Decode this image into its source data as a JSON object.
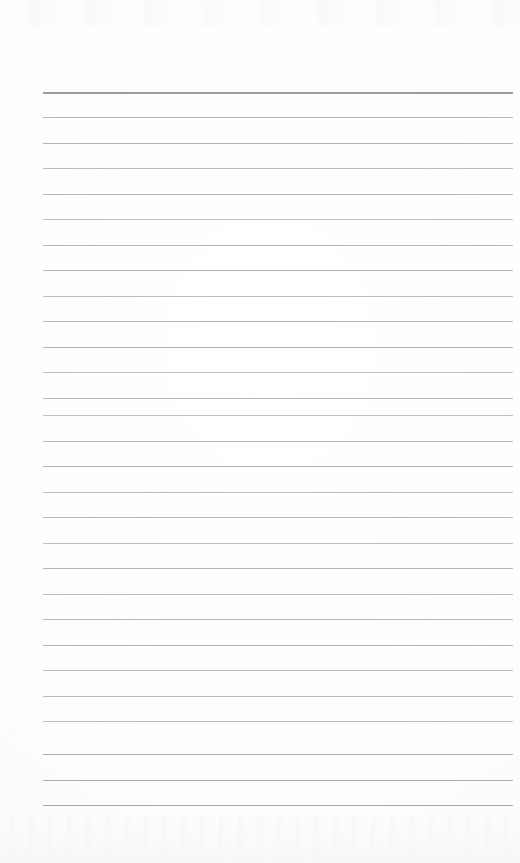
{
  "document": {
    "kind": "scanned-lined-notepad-page",
    "title": "Blank lined notepad page",
    "page_width_px": 520,
    "page_height_px": 863,
    "has_text_content": false,
    "visible_text": "",
    "orientation": "portrait"
  },
  "paper": {
    "background_color": "#fdfdfd",
    "edge_tint_color": "#f9f9fa",
    "noise_color": "#96969e",
    "bottom_smudge_color": "#f1f1f4",
    "top_smudge_color": "#eeeef2"
  },
  "ruling": {
    "line_count": 29,
    "line_color": "#b4b4ba",
    "header_line_color": "#9a9aa0",
    "left_x_px": 43,
    "right_x_px": 513,
    "line_length_px": 470,
    "first_line_y_px": 92,
    "last_line_y_px": 805,
    "line_spacing_px": 25.45,
    "header_line_thickness_px": 2,
    "line_thickness_px": 1,
    "lines": [
      {
        "index": 1,
        "y": 92,
        "weight": "heavy",
        "color": "#9a9aa0",
        "opacity": 1.0
      },
      {
        "index": 2,
        "y": 117,
        "weight": "normal",
        "color": "#b0b0b6",
        "opacity": 0.92
      },
      {
        "index": 3,
        "y": 143,
        "weight": "normal",
        "color": "#aeaeb5",
        "opacity": 0.95
      },
      {
        "index": 4,
        "y": 168,
        "weight": "normal",
        "color": "#b2b2b8",
        "opacity": 0.9
      },
      {
        "index": 5,
        "y": 194,
        "weight": "normal",
        "color": "#b0b0b7",
        "opacity": 0.93
      },
      {
        "index": 6,
        "y": 219,
        "weight": "normal",
        "color": "#b4b4ba",
        "opacity": 0.88
      },
      {
        "index": 7,
        "y": 245,
        "weight": "normal",
        "color": "#b1b1b8",
        "opacity": 0.92
      },
      {
        "index": 8,
        "y": 270,
        "weight": "normal",
        "color": "#afafb6",
        "opacity": 0.94
      },
      {
        "index": 9,
        "y": 296,
        "weight": "normal",
        "color": "#b3b3b9",
        "opacity": 0.89
      },
      {
        "index": 10,
        "y": 321,
        "weight": "normal",
        "color": "#b0b0b7",
        "opacity": 0.93
      },
      {
        "index": 11,
        "y": 347,
        "weight": "normal",
        "color": "#aeaeb5",
        "opacity": 0.95
      },
      {
        "index": 12,
        "y": 372,
        "weight": "normal",
        "color": "#b4b4ba",
        "opacity": 0.88
      },
      {
        "index": 13,
        "y": 398,
        "weight": "normal",
        "color": "#b1b1b8",
        "opacity": 0.92
      },
      {
        "index": 14,
        "y": 415,
        "weight": "normal",
        "color": "#b5b5ba",
        "opacity": 0.86
      },
      {
        "index": 15,
        "y": 441,
        "weight": "normal",
        "color": "#b0b0b7",
        "opacity": 0.93
      },
      {
        "index": 16,
        "y": 466,
        "weight": "normal",
        "color": "#aeaeb5",
        "opacity": 0.95
      },
      {
        "index": 17,
        "y": 492,
        "weight": "normal",
        "color": "#b3b3b9",
        "opacity": 0.89
      },
      {
        "index": 18,
        "y": 517,
        "weight": "normal",
        "color": "#b1b1b8",
        "opacity": 0.92
      },
      {
        "index": 19,
        "y": 543,
        "weight": "normal",
        "color": "#b4b4ba",
        "opacity": 0.88
      },
      {
        "index": 20,
        "y": 568,
        "weight": "normal",
        "color": "#afafb6",
        "opacity": 0.94
      },
      {
        "index": 21,
        "y": 594,
        "weight": "normal",
        "color": "#b2b2b8",
        "opacity": 0.9
      },
      {
        "index": 22,
        "y": 619,
        "weight": "normal",
        "color": "#b0b0b7",
        "opacity": 0.93
      },
      {
        "index": 23,
        "y": 645,
        "weight": "normal",
        "color": "#aeaeb5",
        "opacity": 0.95
      },
      {
        "index": 24,
        "y": 670,
        "weight": "normal",
        "color": "#b3b3b9",
        "opacity": 0.89
      },
      {
        "index": 25,
        "y": 696,
        "weight": "normal",
        "color": "#b1b1b8",
        "opacity": 0.92
      },
      {
        "index": 26,
        "y": 721,
        "weight": "normal",
        "color": "#b4b4ba",
        "opacity": 0.88
      },
      {
        "index": 27,
        "y": 754,
        "weight": "normal",
        "color": "#a9a9b1",
        "opacity": 0.97
      },
      {
        "index": 28,
        "y": 780,
        "weight": "normal",
        "color": "#a7a7af",
        "opacity": 0.98
      },
      {
        "index": 29,
        "y": 805,
        "weight": "normal",
        "color": "#a5a5ad",
        "opacity": 1.0
      }
    ]
  }
}
